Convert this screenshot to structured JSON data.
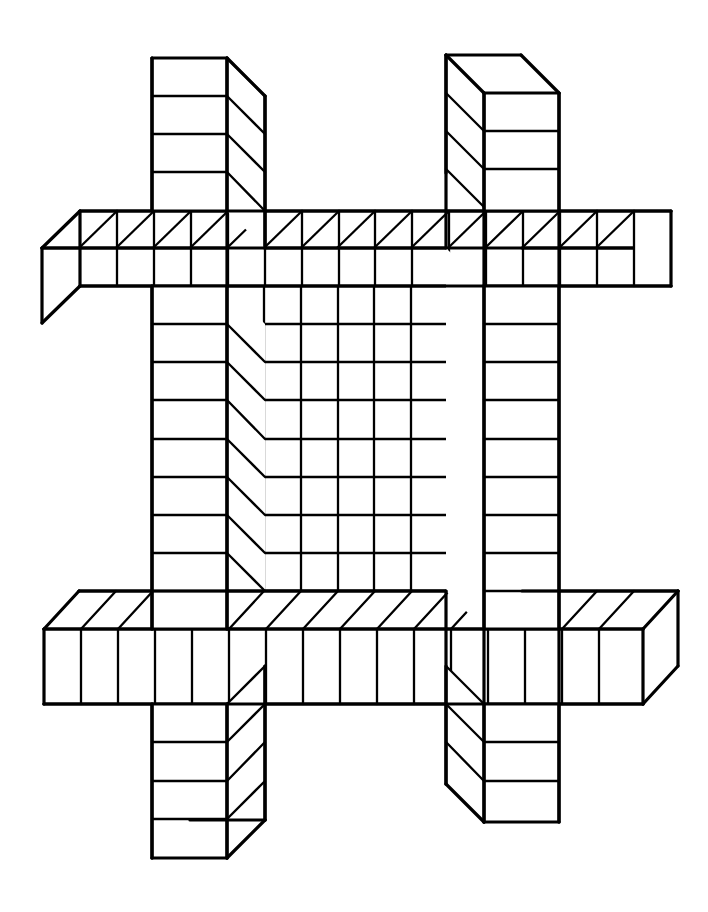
{
  "document": {
    "title": "Impossible Lattice Figure",
    "kind": "line-drawing",
    "description": "Black-and-white line drawing of an impossible hash-shaped lattice built from four long rectangular beams (two horizontal, two vertical) that interpenetrate, each beam drawn as a row of unit cubes in oblique projection with contradictory depth directions.",
    "background_color": "#ffffff",
    "ink_color": "#000000",
    "canvas": {
      "width": 708,
      "height": 912
    }
  },
  "geometry": {
    "cell_size": 38,
    "depth_dx": 38,
    "depth_dy": 38,
    "stroke_major": 3.2,
    "stroke_minor": 2.3,
    "grid_origin_x": 152,
    "grid_origin_y": 58
  },
  "beams": [
    {
      "id": "vertical-left",
      "name": "left-vertical-beam",
      "orientation": "vertical",
      "front_left_x": 152,
      "front_right_x": 227,
      "top_y": 58,
      "bottom_y": 858,
      "depth_direction": "down-right",
      "segment_count": 21,
      "exposed_end": "bottom",
      "label": "Left vertical beam"
    },
    {
      "id": "vertical-right",
      "name": "right-vertical-beam",
      "orientation": "vertical",
      "front_left_x": 484,
      "front_right_x": 559,
      "top_y": 93,
      "bottom_y": 822,
      "depth_direction": "up-left",
      "segment_count": 19,
      "exposed_end": "top",
      "label": "Right vertical beam"
    },
    {
      "id": "horizontal-upper",
      "name": "upper-horizontal-beam",
      "orientation": "horizontal",
      "front_top_y": 211,
      "front_bottom_y": 286,
      "left_x": 80,
      "right_x": 671,
      "depth_direction": "down-left",
      "segment_count": 16,
      "exposed_end": "left",
      "label": "Upper horizontal beam"
    },
    {
      "id": "horizontal-lower",
      "name": "lower-horizontal-beam",
      "orientation": "horizontal",
      "front_top_y": 629,
      "front_bottom_y": 704,
      "left_x": 44,
      "right_x": 643,
      "depth_direction": "up-right",
      "segment_count": 16,
      "exposed_end": "both",
      "label": "Lower horizontal beam"
    }
  ],
  "center_panel": {
    "name": "central-grid-panel",
    "left_x": 227,
    "right_x": 484,
    "top_y": 286,
    "bottom_y": 629,
    "columns": 7,
    "rows": 9,
    "label": "Central recessed grid"
  },
  "legend": {
    "figure_type": "impossible-object",
    "projection": "oblique / cabinet",
    "line_style": "solid black outline on white",
    "fill": "none"
  }
}
